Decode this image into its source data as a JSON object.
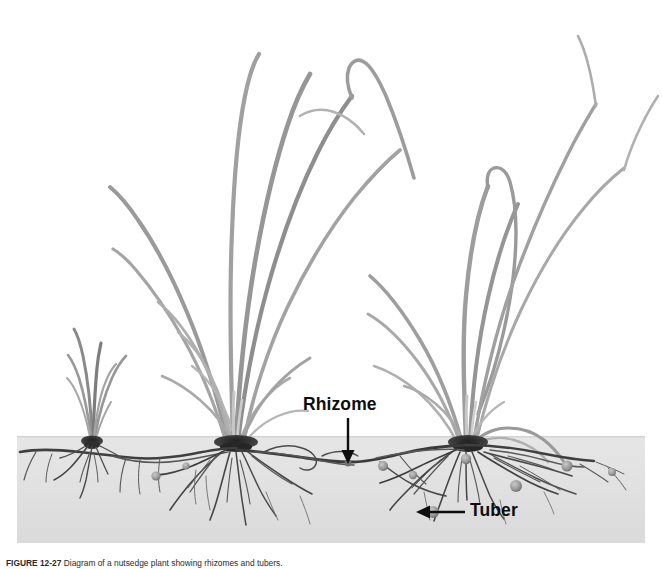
{
  "figure": {
    "background_color": "#ffffff",
    "soil": {
      "label": "soil layer",
      "color_top": "#e3e3e3",
      "color_bottom": "#dcdcdc",
      "x": 17,
      "y": 436,
      "width": 628,
      "height": 107
    },
    "annotations": [
      {
        "id": "rhizome",
        "text": "Rhizome",
        "arrow_direction": "down",
        "color": "#0d0d0d"
      },
      {
        "id": "tuber",
        "text": "Tuber",
        "arrow_direction": "left",
        "color": "#0d0d0d"
      }
    ],
    "plants": [
      {
        "id": "seedling",
        "description": "young nutsedge seedling"
      },
      {
        "id": "mature-center",
        "description": "mature nutsedge plant"
      },
      {
        "id": "mature-right",
        "description": "mature nutsedge plant"
      }
    ],
    "structures": {
      "rhizome_color": "#3a3a3a",
      "root_color": "#4a4a4a",
      "tuber_color": "#8c8c8c",
      "foliage_color": "#9a9a9a"
    },
    "caption": {
      "number": "FIGURE 12-27",
      "text": "Diagram of a nutsedge plant showing rhizomes and tubers."
    }
  }
}
